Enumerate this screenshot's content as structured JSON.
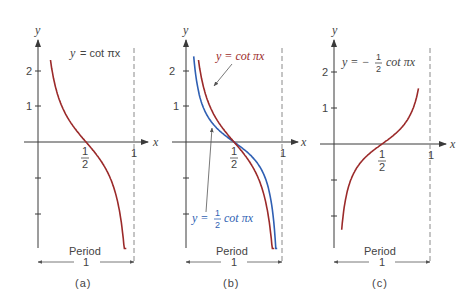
{
  "colors": {
    "red": "#9b2a2a",
    "blue": "#2f5fb3",
    "axis": "#3a3a3a",
    "text": "#444444"
  },
  "chart_data": [
    {
      "type": "line",
      "panel": "(a)",
      "title": "y = cot πx",
      "xlabel": "x",
      "ylabel": "y",
      "xticks": [
        "1/2",
        "1"
      ],
      "yticks": [
        "2",
        "1"
      ],
      "ylim": [
        -3,
        2.6
      ],
      "xlim": [
        0,
        1
      ],
      "asymptote_x": 1,
      "period_label": "Period",
      "period_value": "1",
      "series": [
        {
          "name": "y = cot πx",
          "color": "#9b2a2a",
          "fn": "cot",
          "a": 1,
          "xrange": [
            0.13,
            0.92
          ]
        }
      ]
    },
    {
      "type": "line",
      "panel": "(b)",
      "xlabel": "x",
      "ylabel": "y",
      "xticks": [
        "1/2",
        "1"
      ],
      "yticks": [
        "2",
        "1"
      ],
      "ylim": [
        -3,
        2.6
      ],
      "xlim": [
        0,
        1
      ],
      "asymptote_x": 1,
      "period_label": "Period",
      "period_value": "1",
      "series": [
        {
          "name": "y = cot πx",
          "color": "#9b2a2a",
          "fn": "cot",
          "a": 1,
          "xrange": [
            0.13,
            0.92
          ]
        },
        {
          "name": "y = 1/2 cot πx",
          "color": "#2f5fb3",
          "fn": "cot",
          "a": 1,
          "xrange": [
            0.08,
            0.95
          ]
        }
      ]
    },
    {
      "type": "line",
      "panel": "(c)",
      "title": "y = −1/2 cot πx",
      "xlabel": "x",
      "ylabel": "y",
      "xticks": [
        "1/2",
        "1"
      ],
      "yticks": [
        "2",
        "1"
      ],
      "ylim": [
        -3,
        2.6
      ],
      "xlim": [
        0,
        1
      ],
      "asymptote_x": 1,
      "period_label": "Period",
      "period_value": "1",
      "series": [
        {
          "name": "y = −1/2 cot πx",
          "color": "#9b2a2a",
          "fn": "cot",
          "a": -1,
          "xrange": [
            0.08,
            0.88
          ]
        }
      ]
    }
  ],
  "labels": {
    "a": {
      "eq_lhs": "y",
      "eq_rhs": "= cot πx",
      "caption": "(a)"
    },
    "b": {
      "red_eq": "y = cot πx",
      "blue_eq_lhs": "y =",
      "blue_frac_num": "1",
      "blue_frac_den": "2",
      "blue_eq_rhs": "cot πx",
      "caption": "(b)"
    },
    "c": {
      "eq_lhs": "y = −",
      "frac_num": "1",
      "frac_den": "2",
      "eq_rhs": "cot πx",
      "caption": "(c)"
    }
  },
  "axis": {
    "x": "x",
    "y": "y",
    "half_num": "1",
    "half_den": "2",
    "one": "1",
    "two": "2",
    "period": "Period",
    "period_val": "1"
  }
}
